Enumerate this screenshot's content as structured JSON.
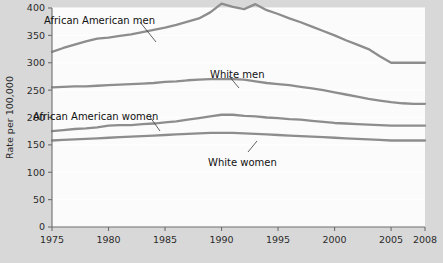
{
  "chart_data": {
    "type": "line",
    "title": "",
    "xlabel": "",
    "ylabel": "Rate per 100,000",
    "xlim": [
      1975,
      2008
    ],
    "ylim": [
      0,
      400
    ],
    "grid": true,
    "legend_position": "inline-annotations",
    "ytick_labels": [
      "0",
      "50",
      "100",
      "150",
      "200",
      "250",
      "300",
      "350",
      "400"
    ],
    "ytick_values": [
      0,
      50,
      100,
      150,
      200,
      250,
      300,
      350,
      400
    ],
    "xtick_labels": [
      "1975",
      "1980",
      "1985",
      "1990",
      "1995",
      "2000",
      "2005",
      "2008"
    ],
    "xtick_values": [
      1975,
      1980,
      1985,
      1990,
      1995,
      2000,
      2005,
      2008
    ],
    "x": [
      1975,
      1976,
      1977,
      1978,
      1979,
      1980,
      1981,
      1982,
      1983,
      1984,
      1985,
      1986,
      1987,
      1988,
      1989,
      1990,
      1991,
      1992,
      1993,
      1994,
      1995,
      1996,
      1997,
      1998,
      1999,
      2000,
      2001,
      2002,
      2003,
      2004,
      2005,
      2006,
      2007,
      2008
    ],
    "series": [
      {
        "name": "African American men",
        "annotation": "African American men",
        "color": "#8d8d8d",
        "values": [
          320,
          327,
          333,
          339,
          344,
          346,
          349,
          352,
          356,
          360,
          364,
          369,
          375,
          381,
          392,
          408,
          402,
          398,
          407,
          396,
          389,
          381,
          374,
          366,
          358,
          350,
          341,
          333,
          325,
          312,
          300,
          300,
          300,
          300
        ]
      },
      {
        "name": "White men",
        "annotation": "White men",
        "color": "#8d8d8d",
        "values": [
          255,
          256,
          257,
          257,
          258,
          259,
          260,
          261,
          262,
          263,
          265,
          266,
          268,
          269,
          270,
          270,
          270,
          269,
          266,
          263,
          261,
          259,
          256,
          253,
          250,
          246,
          242,
          238,
          234,
          231,
          228,
          226,
          225,
          225
        ]
      },
      {
        "name": "African American women",
        "annotation": "African American women",
        "color": "#8d8d8d",
        "values": [
          175,
          177,
          179,
          180,
          182,
          185,
          186,
          186,
          188,
          189,
          191,
          193,
          196,
          199,
          202,
          205,
          205,
          203,
          202,
          200,
          199,
          197,
          196,
          194,
          192,
          190,
          189,
          188,
          187,
          186,
          185,
          185,
          185,
          185
        ]
      },
      {
        "name": "White women",
        "annotation": "White women",
        "color": "#8d8d8d",
        "values": [
          158,
          159,
          160,
          161,
          162,
          163,
          164,
          165,
          166,
          167,
          168,
          169,
          170,
          171,
          172,
          172,
          172,
          171,
          170,
          169,
          168,
          167,
          166,
          165,
          164,
          163,
          162,
          161,
          160,
          159,
          158,
          158,
          158,
          158
        ]
      }
    ],
    "annotations": [
      {
        "text": "African American men",
        "x_px": 44,
        "y_px": 16,
        "leader": [
          [
            140,
            22
          ],
          [
            156,
            42
          ]
        ]
      },
      {
        "text": "White men",
        "x_px": 210,
        "y_px": 70,
        "leader": [
          [
            229,
            76
          ],
          [
            239,
            88
          ]
        ]
      },
      {
        "text": "African American women",
        "x_px": 33,
        "y_px": 112,
        "leader": [
          [
            150,
            117
          ],
          [
            160,
            131
          ]
        ]
      },
      {
        "text": "White women",
        "x_px": 208,
        "y_px": 158,
        "leader": [
          [
            248,
            152
          ],
          [
            257,
            141
          ]
        ]
      }
    ],
    "colors": {
      "outer_background": "#d8d8d8",
      "plot_background": "#fbfbfb",
      "gridline": "#ffffff",
      "axis": "#6e6e6e",
      "line": "#8d8d8d",
      "text": "#2b2b2b"
    }
  }
}
